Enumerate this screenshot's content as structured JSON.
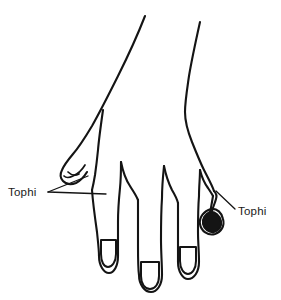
{
  "figure": {
    "view": "dorsal-hand-fingers-down",
    "background_color": "#ffffff",
    "line_color": "#141414"
  },
  "annotations": {
    "left": {
      "label": "Tophi",
      "text_x": 8,
      "text_y": 196,
      "leader_style": "forked-two-branch",
      "points_to": [
        "thumb-tip",
        "index-finger-knuckle"
      ]
    },
    "right": {
      "label": "Tophi",
      "text_x": 238,
      "text_y": 215,
      "leader_style": "single-diagonal",
      "points_to": [
        "little-finger-tip"
      ]
    }
  },
  "parts": {
    "thumb": "thumb",
    "index_finger": "index-finger",
    "middle_finger": "middle-finger",
    "ring_finger": "ring-finger",
    "little_finger": "little-finger",
    "wrist": "wrist"
  }
}
